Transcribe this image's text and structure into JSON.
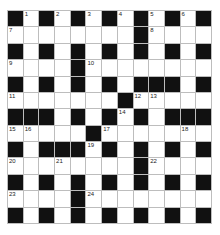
{
  "puzzle": {
    "rows": 13,
    "cols": 13,
    "colors": {
      "block": "#111111",
      "cell": "#ffffff",
      "line": "#bdbdbd",
      "number": "#222222"
    },
    "layout": [
      "B.B.B.B.B.B.B",
      "........B....",
      "B.B.B.B.B.B.B",
      "....B........",
      "B.B.B.B.BBB.B",
      ".......B.....",
      "BBB.B.B.B.BBB",
      ".....B.......",
      "B.BBB.B.B.B.B",
      "........B....",
      "B.B.B.B.B.B.B",
      "....B........",
      "B.B.B.B.B.B.B"
    ],
    "numbers": [
      {
        "row": 0,
        "col": 1,
        "n": "1"
      },
      {
        "row": 0,
        "col": 3,
        "n": "2"
      },
      {
        "row": 0,
        "col": 5,
        "n": "3"
      },
      {
        "row": 0,
        "col": 7,
        "n": "4"
      },
      {
        "row": 0,
        "col": 9,
        "n": "5"
      },
      {
        "row": 0,
        "col": 11,
        "n": "6"
      },
      {
        "row": 1,
        "col": 0,
        "n": "7"
      },
      {
        "row": 1,
        "col": 9,
        "n": "8"
      },
      {
        "row": 3,
        "col": 0,
        "n": "9"
      },
      {
        "row": 3,
        "col": 5,
        "n": "10"
      },
      {
        "row": 5,
        "col": 0,
        "n": "11"
      },
      {
        "row": 5,
        "col": 8,
        "n": "12"
      },
      {
        "row": 5,
        "col": 9,
        "n": "13"
      },
      {
        "row": 6,
        "col": 7,
        "n": "14"
      },
      {
        "row": 7,
        "col": 0,
        "n": "15"
      },
      {
        "row": 7,
        "col": 1,
        "n": "16"
      },
      {
        "row": 7,
        "col": 6,
        "n": "17"
      },
      {
        "row": 7,
        "col": 11,
        "n": "18"
      },
      {
        "row": 8,
        "col": 5,
        "n": "19"
      },
      {
        "row": 9,
        "col": 0,
        "n": "20"
      },
      {
        "row": 9,
        "col": 3,
        "n": "21"
      },
      {
        "row": 9,
        "col": 9,
        "n": "22"
      },
      {
        "row": 11,
        "col": 0,
        "n": "23"
      },
      {
        "row": 11,
        "col": 5,
        "n": "24"
      }
    ]
  }
}
